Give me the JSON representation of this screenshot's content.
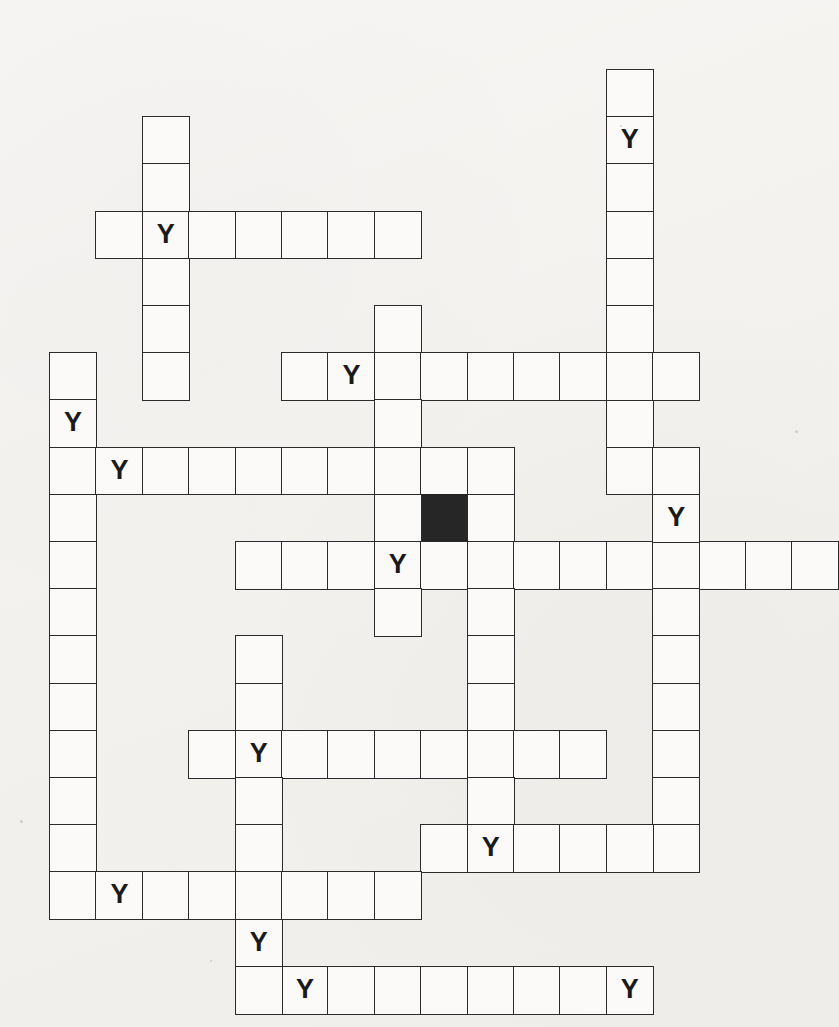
{
  "puzzle": {
    "type": "crossword-grid",
    "title": "Blank crossword grid with Y letters",
    "cell_size": 46.4,
    "origin_x": 49,
    "origin_y": 69,
    "row_height": 47.2,
    "colors": {
      "paper": "#f3f2ef",
      "cell_fill": "#fbfaf8",
      "cell_border": "#2b2b2b",
      "blocked_fill": "#262626",
      "letter": "#1a1a1a"
    },
    "letter": "Y",
    "entries": [
      {
        "name": "down-col2-top",
        "dir": "down",
        "col": 2,
        "row": 1,
        "length": 6
      },
      {
        "name": "across-row3-left",
        "dir": "across",
        "col": 1,
        "row": 3,
        "length": 7
      },
      {
        "name": "down-col12-top",
        "dir": "down",
        "col": 12,
        "row": 0,
        "length": 9
      },
      {
        "name": "down-col7-mid",
        "dir": "down",
        "col": 7,
        "row": 5,
        "length": 7
      },
      {
        "name": "across-row6-mid",
        "dir": "across",
        "col": 5,
        "row": 6,
        "length": 9
      },
      {
        "name": "down-col0-left",
        "dir": "down",
        "col": 0,
        "row": 6,
        "length": 11
      },
      {
        "name": "across-row8-long",
        "dir": "across",
        "col": 0,
        "row": 8,
        "length": 10
      },
      {
        "name": "down-col9-mid",
        "dir": "down",
        "col": 9,
        "row": 8,
        "length": 8
      },
      {
        "name": "across-row10-long",
        "dir": "across",
        "col": 4,
        "row": 10,
        "length": 13
      },
      {
        "name": "down-col13-right",
        "dir": "down",
        "col": 13,
        "row": 8,
        "length": 9
      },
      {
        "name": "down-col4-lower",
        "dir": "down",
        "col": 4,
        "row": 12,
        "length": 8
      },
      {
        "name": "across-row14-mid",
        "dir": "across",
        "col": 3,
        "row": 14,
        "length": 9
      },
      {
        "name": "across-row16-right",
        "dir": "across",
        "col": 8,
        "row": 16,
        "length": 6
      },
      {
        "name": "across-row17-left",
        "dir": "across",
        "col": 0,
        "row": 17,
        "length": 8
      },
      {
        "name": "across-row19-bottom",
        "dir": "across",
        "col": 4,
        "row": 19,
        "length": 9
      }
    ],
    "cells": [
      {
        "col": 2,
        "row": 1,
        "letter": ""
      },
      {
        "col": 2,
        "row": 2,
        "letter": ""
      },
      {
        "col": 1,
        "row": 3,
        "letter": ""
      },
      {
        "col": 2,
        "row": 3,
        "letter": "Y"
      },
      {
        "col": 3,
        "row": 3,
        "letter": ""
      },
      {
        "col": 4,
        "row": 3,
        "letter": ""
      },
      {
        "col": 5,
        "row": 3,
        "letter": ""
      },
      {
        "col": 6,
        "row": 3,
        "letter": ""
      },
      {
        "col": 7,
        "row": 3,
        "letter": ""
      },
      {
        "col": 2,
        "row": 4,
        "letter": ""
      },
      {
        "col": 2,
        "row": 5,
        "letter": ""
      },
      {
        "col": 2,
        "row": 6,
        "letter": ""
      },
      {
        "col": 12,
        "row": 0,
        "letter": ""
      },
      {
        "col": 12,
        "row": 1,
        "letter": "Y"
      },
      {
        "col": 12,
        "row": 2,
        "letter": ""
      },
      {
        "col": 12,
        "row": 3,
        "letter": ""
      },
      {
        "col": 12,
        "row": 4,
        "letter": ""
      },
      {
        "col": 12,
        "row": 5,
        "letter": ""
      },
      {
        "col": 12,
        "row": 6,
        "letter": ""
      },
      {
        "col": 12,
        "row": 7,
        "letter": ""
      },
      {
        "col": 12,
        "row": 8,
        "letter": ""
      },
      {
        "col": 7,
        "row": 5,
        "letter": ""
      },
      {
        "col": 5,
        "row": 6,
        "letter": ""
      },
      {
        "col": 6,
        "row": 6,
        "letter": "Y"
      },
      {
        "col": 7,
        "row": 6,
        "letter": ""
      },
      {
        "col": 8,
        "row": 6,
        "letter": ""
      },
      {
        "col": 9,
        "row": 6,
        "letter": ""
      },
      {
        "col": 10,
        "row": 6,
        "letter": ""
      },
      {
        "col": 11,
        "row": 6,
        "letter": ""
      },
      {
        "col": 12,
        "row": 6,
        "letter": ""
      },
      {
        "col": 13,
        "row": 6,
        "letter": ""
      },
      {
        "col": 7,
        "row": 7,
        "letter": ""
      },
      {
        "col": 0,
        "row": 6,
        "letter": ""
      },
      {
        "col": 0,
        "row": 7,
        "letter": "Y"
      },
      {
        "col": 0,
        "row": 8,
        "letter": ""
      },
      {
        "col": 0,
        "row": 9,
        "letter": ""
      },
      {
        "col": 0,
        "row": 10,
        "letter": ""
      },
      {
        "col": 0,
        "row": 11,
        "letter": ""
      },
      {
        "col": 0,
        "row": 12,
        "letter": ""
      },
      {
        "col": 0,
        "row": 13,
        "letter": ""
      },
      {
        "col": 0,
        "row": 14,
        "letter": ""
      },
      {
        "col": 0,
        "row": 15,
        "letter": ""
      },
      {
        "col": 0,
        "row": 16,
        "letter": ""
      },
      {
        "col": 0,
        "row": 17,
        "letter": ""
      },
      {
        "col": 1,
        "row": 8,
        "letter": "Y"
      },
      {
        "col": 2,
        "row": 8,
        "letter": ""
      },
      {
        "col": 3,
        "row": 8,
        "letter": ""
      },
      {
        "col": 4,
        "row": 8,
        "letter": ""
      },
      {
        "col": 5,
        "row": 8,
        "letter": ""
      },
      {
        "col": 6,
        "row": 8,
        "letter": ""
      },
      {
        "col": 7,
        "row": 8,
        "letter": ""
      },
      {
        "col": 8,
        "row": 8,
        "letter": ""
      },
      {
        "col": 9,
        "row": 8,
        "letter": ""
      },
      {
        "col": 8,
        "row": 9,
        "letter": "#"
      },
      {
        "col": 9,
        "row": 9,
        "letter": ""
      },
      {
        "col": 7,
        "row": 9,
        "letter": ""
      },
      {
        "col": 4,
        "row": 10,
        "letter": ""
      },
      {
        "col": 5,
        "row": 10,
        "letter": ""
      },
      {
        "col": 6,
        "row": 10,
        "letter": ""
      },
      {
        "col": 7,
        "row": 10,
        "letter": "Y"
      },
      {
        "col": 8,
        "row": 10,
        "letter": ""
      },
      {
        "col": 9,
        "row": 10,
        "letter": ""
      },
      {
        "col": 10,
        "row": 10,
        "letter": ""
      },
      {
        "col": 11,
        "row": 10,
        "letter": ""
      },
      {
        "col": 12,
        "row": 10,
        "letter": ""
      },
      {
        "col": 13,
        "row": 10,
        "letter": ""
      },
      {
        "col": 14,
        "row": 10,
        "letter": ""
      },
      {
        "col": 15,
        "row": 10,
        "letter": ""
      },
      {
        "col": 16,
        "row": 10,
        "letter": ""
      },
      {
        "col": 7,
        "row": 11,
        "letter": ""
      },
      {
        "col": 9,
        "row": 11,
        "letter": ""
      },
      {
        "col": 13,
        "row": 8,
        "letter": ""
      },
      {
        "col": 13,
        "row": 9,
        "letter": "Y"
      },
      {
        "col": 13,
        "row": 11,
        "letter": ""
      },
      {
        "col": 13,
        "row": 12,
        "letter": ""
      },
      {
        "col": 13,
        "row": 13,
        "letter": ""
      },
      {
        "col": 13,
        "row": 14,
        "letter": ""
      },
      {
        "col": 13,
        "row": 15,
        "letter": ""
      },
      {
        "col": 13,
        "row": 16,
        "letter": ""
      },
      {
        "col": 4,
        "row": 12,
        "letter": ""
      },
      {
        "col": 4,
        "row": 13,
        "letter": ""
      },
      {
        "col": 3,
        "row": 14,
        "letter": ""
      },
      {
        "col": 4,
        "row": 14,
        "letter": "Y"
      },
      {
        "col": 5,
        "row": 14,
        "letter": ""
      },
      {
        "col": 6,
        "row": 14,
        "letter": ""
      },
      {
        "col": 7,
        "row": 14,
        "letter": ""
      },
      {
        "col": 8,
        "row": 14,
        "letter": ""
      },
      {
        "col": 9,
        "row": 14,
        "letter": ""
      },
      {
        "col": 10,
        "row": 14,
        "letter": ""
      },
      {
        "col": 11,
        "row": 14,
        "letter": ""
      },
      {
        "col": 4,
        "row": 15,
        "letter": ""
      },
      {
        "col": 4,
        "row": 16,
        "letter": ""
      },
      {
        "col": 4,
        "row": 17,
        "letter": ""
      },
      {
        "col": 4,
        "row": 18,
        "letter": "Y"
      },
      {
        "col": 9,
        "row": 12,
        "letter": ""
      },
      {
        "col": 9,
        "row": 13,
        "letter": ""
      },
      {
        "col": 9,
        "row": 15,
        "letter": ""
      },
      {
        "col": 8,
        "row": 16,
        "letter": ""
      },
      {
        "col": 9,
        "row": 16,
        "letter": "Y"
      },
      {
        "col": 10,
        "row": 16,
        "letter": ""
      },
      {
        "col": 11,
        "row": 16,
        "letter": ""
      },
      {
        "col": 12,
        "row": 16,
        "letter": ""
      },
      {
        "col": 1,
        "row": 17,
        "letter": "Y"
      },
      {
        "col": 2,
        "row": 17,
        "letter": ""
      },
      {
        "col": 3,
        "row": 17,
        "letter": ""
      },
      {
        "col": 5,
        "row": 17,
        "letter": ""
      },
      {
        "col": 6,
        "row": 17,
        "letter": ""
      },
      {
        "col": 7,
        "row": 17,
        "letter": ""
      },
      {
        "col": 5,
        "row": 19,
        "letter": "Y"
      },
      {
        "col": 6,
        "row": 19,
        "letter": ""
      },
      {
        "col": 7,
        "row": 19,
        "letter": ""
      },
      {
        "col": 8,
        "row": 19,
        "letter": ""
      },
      {
        "col": 9,
        "row": 19,
        "letter": ""
      },
      {
        "col": 10,
        "row": 19,
        "letter": ""
      },
      {
        "col": 11,
        "row": 19,
        "letter": ""
      },
      {
        "col": 12,
        "row": 19,
        "letter": "Y"
      },
      {
        "col": 4,
        "row": 19,
        "letter": ""
      }
    ],
    "specks": [
      {
        "x": 20,
        "y": 820,
        "d": 3
      },
      {
        "x": 795,
        "y": 430,
        "d": 3
      },
      {
        "x": 620,
        "y": 125,
        "d": 2
      },
      {
        "x": 210,
        "y": 960,
        "d": 2
      }
    ]
  }
}
